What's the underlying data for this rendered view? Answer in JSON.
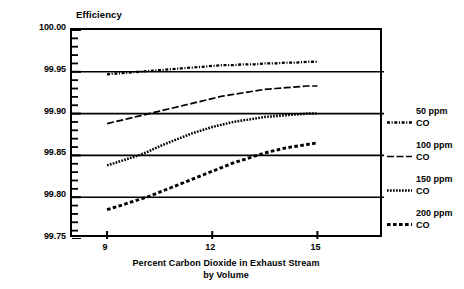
{
  "chart_data": {
    "type": "line",
    "title": "",
    "xlabel": "Percent Carbon Dioxide in Exhaust Stream by Volume",
    "xlabel_line1": "Percent Carbon Dioxide in Exhaust Stream",
    "xlabel_line2": "by Volume",
    "ylabel": "Efficiency",
    "xlim": [
      8.0,
      16.9
    ],
    "ylim": [
      99.75,
      100.0
    ],
    "x_ticks": [
      9,
      12,
      15
    ],
    "x_tick_labels": [
      "9",
      "12",
      "15"
    ],
    "y_ticks": [
      99.75,
      99.8,
      99.85,
      99.9,
      99.95,
      100.0
    ],
    "y_tick_labels": [
      "99.75",
      "99.80",
      "99.85",
      "99.90",
      "99.95",
      "100.00"
    ],
    "y_minor_tick_step": 0.01,
    "grid": "horizontal-major",
    "legend_position": "right",
    "series": [
      {
        "name": "200 ppm CO",
        "label_line1": "200 ppm",
        "label_line2": "CO",
        "style": "square-dash",
        "x": [
          9.0,
          9.3,
          9.6,
          9.9,
          10.2,
          10.5,
          10.8,
          11.1,
          11.4,
          11.7,
          12.0,
          12.3,
          12.6,
          12.9,
          13.2,
          13.5,
          13.8,
          14.1,
          14.4,
          14.7,
          15.0
        ],
        "values": [
          99.785,
          99.789,
          99.793,
          99.797,
          99.801,
          99.806,
          99.811,
          99.816,
          99.821,
          99.826,
          99.831,
          99.836,
          99.841,
          99.845,
          99.849,
          99.853,
          99.856,
          99.859,
          99.861,
          99.863,
          99.865
        ]
      },
      {
        "name": "150 ppm CO",
        "label_line1": "150 ppm",
        "label_line2": "CO",
        "style": "dotted",
        "x": [
          9.0,
          9.3,
          9.6,
          9.9,
          10.2,
          10.5,
          10.8,
          11.1,
          11.4,
          11.7,
          12.0,
          12.3,
          12.6,
          12.9,
          13.2,
          13.5,
          13.8,
          14.1,
          14.4,
          14.7,
          15.0
        ],
        "values": [
          99.838,
          99.842,
          99.846,
          99.85,
          99.855,
          99.861,
          99.866,
          99.871,
          99.876,
          99.88,
          99.884,
          99.887,
          99.89,
          99.892,
          99.894,
          99.896,
          99.897,
          99.898,
          99.899,
          99.9,
          99.9
        ]
      },
      {
        "name": "100 ppm CO",
        "label_line1": "100 ppm",
        "label_line2": "CO",
        "style": "solid",
        "x": [
          9.0,
          9.3,
          9.6,
          9.9,
          10.2,
          10.5,
          10.8,
          11.1,
          11.4,
          11.7,
          12.0,
          12.3,
          12.6,
          12.9,
          13.2,
          13.5,
          13.8,
          14.1,
          14.4,
          14.7,
          15.0
        ],
        "values": [
          99.888,
          99.891,
          99.894,
          99.897,
          99.9,
          99.903,
          99.906,
          99.909,
          99.912,
          99.915,
          99.918,
          99.921,
          99.923,
          99.925,
          99.927,
          99.929,
          99.93,
          99.931,
          99.932,
          99.933,
          99.933
        ]
      },
      {
        "name": "50 ppm CO",
        "label_line1": "50 ppm",
        "label_line2": "CO",
        "style": "dash-dot",
        "x": [
          9.0,
          9.3,
          9.6,
          9.9,
          10.2,
          10.5,
          10.8,
          11.1,
          11.4,
          11.7,
          12.0,
          12.3,
          12.6,
          12.9,
          13.2,
          13.5,
          13.8,
          14.1,
          14.4,
          14.7,
          15.0
        ],
        "values": [
          99.947,
          99.948,
          99.949,
          99.95,
          99.951,
          99.952,
          99.953,
          99.954,
          99.955,
          99.956,
          99.957,
          99.958,
          99.958,
          99.959,
          99.959,
          99.96,
          99.96,
          99.961,
          99.961,
          99.962,
          99.962
        ]
      }
    ]
  },
  "colors": {
    "ink": "#000000",
    "background": "#ffffff"
  }
}
